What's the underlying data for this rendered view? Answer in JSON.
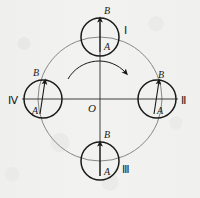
{
  "figure": {
    "name": "rotating-wheel-vector-diagram",
    "center_label": "O",
    "rotation": {
      "indicator": "clockwise-rotation-arrow",
      "direction": "clockwise"
    },
    "axes": {
      "horizontal": "horizontal-axis",
      "vertical": "vertical-axis"
    },
    "big_circle": {
      "cx": 100,
      "cy": 99,
      "r": 62
    },
    "positions": [
      {
        "roman": "Ⅰ",
        "cx": 100,
        "cy": 37,
        "r": 19,
        "tail_label": "A",
        "head_label": "B",
        "tail_x": 100,
        "tail_y": 52,
        "head_x": 100,
        "head_y": 19,
        "roman_x": 126,
        "roman_y": 33,
        "head_label_x": 107,
        "head_label_y": 14,
        "tail_label_x": 107,
        "tail_label_y": 50
      },
      {
        "roman": "Ⅱ",
        "cx": 157,
        "cy": 99,
        "r": 19,
        "tail_label": "A",
        "head_label": "B",
        "tail_x": 154,
        "tail_y": 114,
        "head_x": 160,
        "head_y": 81,
        "roman_x": 184,
        "roman_y": 104,
        "head_label_x": 161,
        "head_label_y": 78,
        "tail_label_x": 161,
        "tail_label_y": 112
      },
      {
        "roman": "Ⅲ",
        "cx": 100,
        "cy": 161,
        "r": 19,
        "tail_label": "A",
        "head_label": "B",
        "tail_x": 100,
        "tail_y": 176,
        "head_x": 100,
        "head_y": 143,
        "roman_x": 126,
        "roman_y": 170,
        "head_label_x": 107,
        "head_label_y": 138,
        "tail_label_x": 107,
        "tail_label_y": 174
      },
      {
        "roman": "Ⅳ",
        "cx": 43,
        "cy": 99,
        "r": 19,
        "tail_label": "A",
        "head_label": "B",
        "tail_x": 40,
        "tail_y": 114,
        "head_x": 46,
        "head_y": 81,
        "roman_x": 12,
        "roman_y": 104,
        "head_label_x": 35,
        "head_label_y": 76,
        "tail_label_x": 34,
        "tail_label_y": 112
      }
    ],
    "colors": {
      "ink": "#1a1a1a",
      "thin_line": "#707070",
      "paper": "#f2f2f0"
    }
  }
}
